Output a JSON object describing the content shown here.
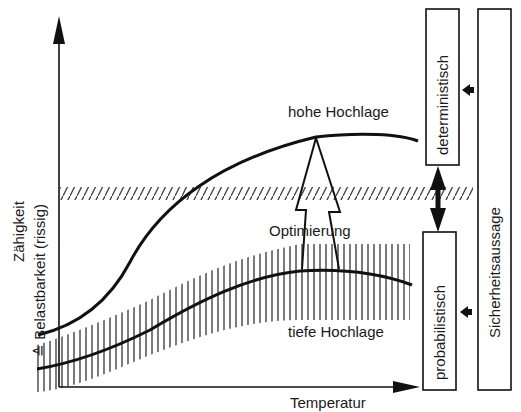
{
  "axes": {
    "y_label_line1": "Zähigkeit",
    "y_label_line2": "≙ Belastbarkeit (rissig)",
    "x_label": "Temperatur"
  },
  "curves": {
    "upper_label": "hohe Hochlage",
    "lower_label": "tiefe Hochlage",
    "arrow_label": "Optimierung"
  },
  "boxes": {
    "deterministic": "deterministisch",
    "probabilistic": "probabilistisch",
    "safety_statement": "Sicherheitsaussage"
  },
  "colors": {
    "ink": "#111111",
    "hatch": "#444444",
    "background": "#ffffff"
  }
}
